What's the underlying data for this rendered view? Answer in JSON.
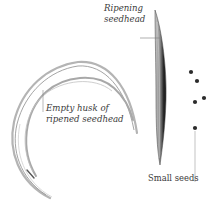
{
  "illustration": {
    "subject": "Grass seedheads",
    "background_color": "#ffffff",
    "line_color": "#8a8a8a",
    "seed_color": "#2b2b2b"
  },
  "labels": {
    "ripening_seedhead": {
      "line1": "Ripening",
      "line2": "seedhead"
    },
    "empty_husk": {
      "line1": "Empty husk of",
      "line2": "ripened seedhead"
    },
    "small_seeds": {
      "text": "Small seeds"
    }
  },
  "seeds": [
    {
      "x": 191,
      "y": 72
    },
    {
      "x": 197,
      "y": 81
    },
    {
      "x": 204,
      "y": 98
    },
    {
      "x": 195,
      "y": 102
    },
    {
      "x": 195,
      "y": 128
    }
  ]
}
